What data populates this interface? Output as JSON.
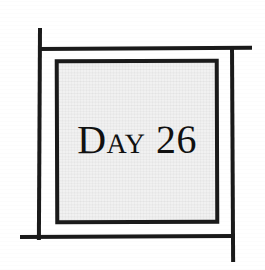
{
  "illustration": {
    "kind": "scanned-chapter-heading",
    "background_color": "#ffffff",
    "ink_color": "#1a1a1a",
    "panel_fill_color": "#f1f1f1",
    "title": "Day 26",
    "frame": {
      "style": "crossed-hash-rule",
      "lines": [
        {
          "name": "top-rule",
          "orientation": "horizontal"
        },
        {
          "name": "bottom-rule",
          "orientation": "horizontal"
        },
        {
          "name": "left-rule",
          "orientation": "vertical"
        },
        {
          "name": "right-rule",
          "orientation": "vertical"
        }
      ]
    },
    "panel": {
      "label": "Day 26",
      "label_style": "small-caps-serif"
    }
  }
}
